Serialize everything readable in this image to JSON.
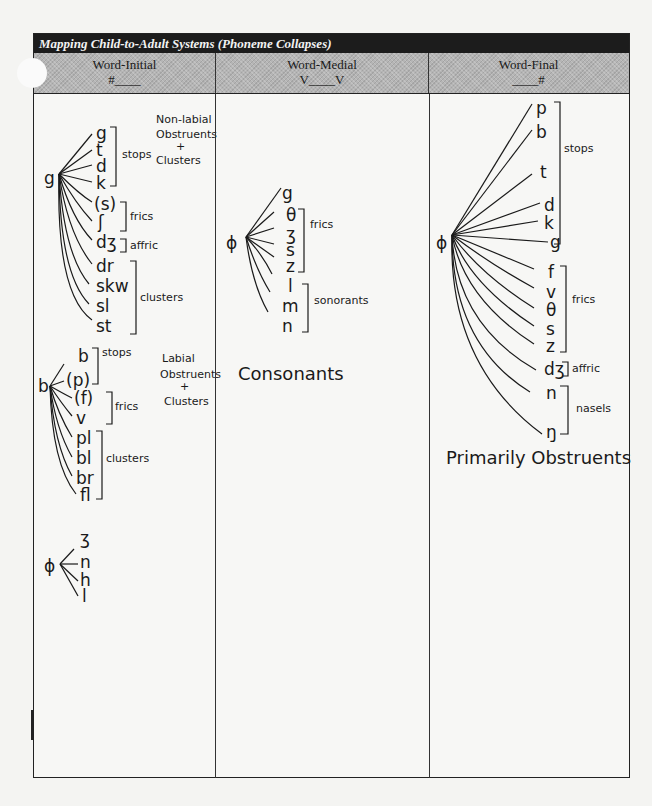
{
  "title": "Mapping Child-to-Adult Systems (Phoneme Collapses)",
  "columns": [
    {
      "label": "Word-Initial",
      "context": "#____"
    },
    {
      "label": "Word-Medial",
      "context": "V____V"
    },
    {
      "label": "Word-Final",
      "context": "____#"
    }
  ],
  "word_initial": {
    "group1": {
      "source": "g",
      "targets": [
        "g",
        "t",
        "d",
        "k",
        "(s)",
        "ʃ",
        "dʒ",
        "dr",
        "skw",
        "sl",
        "st"
      ],
      "brackets": [
        "stops",
        "frics",
        "affric",
        "clusters"
      ],
      "note": [
        "Non-labial",
        "Obstruents",
        "+",
        "Clusters"
      ]
    },
    "group2": {
      "source": "b",
      "targets": [
        "b",
        "(p)",
        "(f)",
        "v",
        "pl",
        "bl",
        "br",
        "fl"
      ],
      "brackets": [
        "stops",
        "frics",
        "clusters"
      ],
      "note": [
        "Labial",
        "Obstruents",
        "+",
        "Clusters"
      ]
    },
    "group3": {
      "source": "ϕ",
      "targets": [
        "ʒ",
        "n",
        "h",
        "l"
      ]
    }
  },
  "word_medial": {
    "source": "ϕ",
    "targets": [
      "g",
      "θ",
      "ʒ",
      "s",
      "z",
      "l",
      "m",
      "n"
    ],
    "brackets": [
      "frics",
      "sonorants"
    ],
    "summary": "Consonants"
  },
  "word_final": {
    "source": "ϕ",
    "targets": [
      "p",
      "b",
      "t",
      "d",
      "k",
      "g",
      "f",
      "v",
      "θ",
      "s",
      "z",
      "dʒ",
      "n",
      "ŋ"
    ],
    "brackets": [
      "stops",
      "frics",
      "affric",
      "nasels"
    ],
    "summary": "Primarily Obstruents"
  }
}
